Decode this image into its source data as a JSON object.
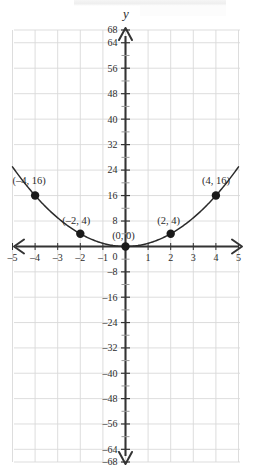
{
  "figure": {
    "axis_label_y": "y",
    "axis_label_x": ""
  },
  "chart_data": {
    "type": "line",
    "title": "",
    "subtitle": "",
    "xlabel": "",
    "ylabel": "y",
    "function": "y = x^2",
    "grid": true,
    "legend_position": "none",
    "xlim": [
      -5,
      5
    ],
    "ylim": [
      -68,
      68
    ],
    "x_tick_labels": [
      "-5",
      "-4",
      "-3",
      "-2",
      "-1",
      "0",
      "1",
      "2",
      "3",
      "4",
      "5"
    ],
    "x_tick_values": [
      -5,
      -4,
      -3,
      -2,
      -1,
      0,
      1,
      2,
      3,
      4,
      5
    ],
    "y_tick_labels": [
      "68",
      "64",
      "56",
      "48",
      "40",
      "32",
      "24",
      "16",
      "8",
      "0",
      "-8",
      "-16",
      "-24",
      "-32",
      "-40",
      "-48",
      "-56",
      "-64",
      "-68"
    ],
    "y_tick_values": [
      68,
      64,
      56,
      48,
      40,
      32,
      24,
      16,
      8,
      0,
      -8,
      -16,
      -24,
      -32,
      -40,
      -48,
      -56,
      -64,
      -68
    ],
    "y_minor_tick_values": [
      4,
      12,
      20,
      28,
      36,
      44,
      52,
      60,
      -4,
      -12,
      -20,
      -28,
      -36,
      -44,
      -52,
      -60
    ],
    "x_grid_step": 1,
    "y_grid_step": 8,
    "series": [
      {
        "name": "y = x^2",
        "x": [
          -5,
          -4.5,
          -4,
          -3.5,
          -3,
          -2.5,
          -2,
          -1.5,
          -1,
          -0.5,
          0,
          0.5,
          1,
          1.5,
          2,
          2.5,
          3,
          3.5,
          4,
          4.5,
          5
        ],
        "values": [
          25,
          20.25,
          16,
          12.25,
          9,
          6.25,
          4,
          2.25,
          1,
          0.25,
          0,
          0.25,
          1,
          2.25,
          4,
          6.25,
          9,
          12.25,
          16,
          20.25,
          25
        ]
      }
    ],
    "points": [
      {
        "x": -4,
        "y": 16,
        "label": "(–4, 16)",
        "label_dx": -6,
        "label_dy": -12,
        "anchor": "middle"
      },
      {
        "x": -2,
        "y": 4,
        "label": "(–2, 4)",
        "label_dx": -4,
        "label_dy": -10,
        "anchor": "middle"
      },
      {
        "x": 0,
        "y": 0,
        "label": "(0, 0)",
        "label_dx": -2,
        "label_dy": -8,
        "anchor": "middle"
      },
      {
        "x": 2,
        "y": 4,
        "label": "(2, 4)",
        "label_dx": -2,
        "label_dy": -10,
        "anchor": "middle"
      },
      {
        "x": 4,
        "y": 16,
        "label": "(4, 16)",
        "label_dx": 0,
        "label_dy": -12,
        "anchor": "middle"
      }
    ],
    "colors": {
      "grid": "#d9d9d9",
      "axis": "#333333",
      "curve": "#2b2b2b",
      "point": "#1a1a1a",
      "text": "#2b2b2b",
      "background": "#ffffff"
    }
  }
}
